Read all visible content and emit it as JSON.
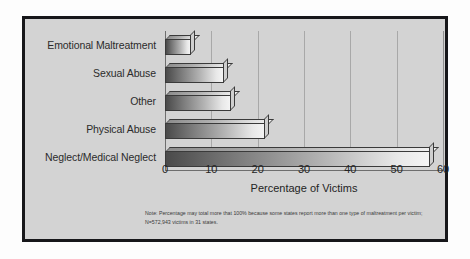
{
  "chart_data": {
    "type": "bar",
    "orientation": "horizontal",
    "title": "",
    "xlabel": "Percentage of Victims",
    "ylabel": "",
    "categories": [
      "Emotional Maltreatment",
      "Sexual Abuse",
      "Other",
      "Physical Abuse",
      "Neglect/Medical Neglect"
    ],
    "values": [
      6.5,
      13.5,
      15,
      22.5,
      58
    ],
    "xlim": [
      0,
      60
    ],
    "ylim": null,
    "xticks": [
      "0",
      "10",
      "20",
      "30",
      "40",
      "50",
      "60"
    ],
    "xtick_values": [
      0,
      10,
      20,
      30,
      40,
      50,
      60
    ],
    "grid": "vertical",
    "legend": null,
    "annotations": [
      "Note: Percentage may total more that 100% because some states report more than one type of maltreatment per victim; N=572,943 victims in 31 states."
    ],
    "style": {
      "background": "#d3d3d3",
      "frame_color": "#17171a",
      "bar_gradient_start": "#4a4a4a",
      "bar_gradient_end": "#f4f4f4",
      "gridline_color": "#a8a8a8",
      "text_color": "#242424"
    }
  },
  "note": {
    "text": "Note: Percentage may total more that 100% because some states report more than one type of maltreatment per victim; N=572,943 victims in 31 states."
  },
  "axis": {
    "x_title": "Percentage of Victims"
  }
}
